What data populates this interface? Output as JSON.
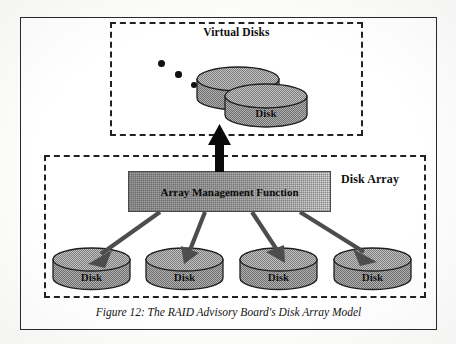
{
  "figure": {
    "caption": "Figure 12: The RAID Advisory Board's Disk Array Model"
  },
  "virtual_disks": {
    "title": "Virtual Disks",
    "subtitle": "(Image presented to operating environment)",
    "ellipsis_dot_count": 3,
    "disks": [
      {
        "label": "Disk"
      },
      {
        "label": "Disk"
      }
    ]
  },
  "disk_array": {
    "title": "Disk Array",
    "management_function": {
      "label": "Array Management Function"
    },
    "disks": [
      {
        "label": "Disk"
      },
      {
        "label": "Disk"
      },
      {
        "label": "Disk"
      },
      {
        "label": "Disk"
      }
    ]
  },
  "colors": {
    "ink": "#111111",
    "frame": "#2a2a2a",
    "disk_fill": "#a3a3a3",
    "disk_top": "#b6b6b6",
    "amf_fill_left": "#9c9c9c",
    "amf_fill_right": "#dcdcdc",
    "arrow": "#4d4d4d",
    "arrow_up": "#0a0a0a"
  }
}
